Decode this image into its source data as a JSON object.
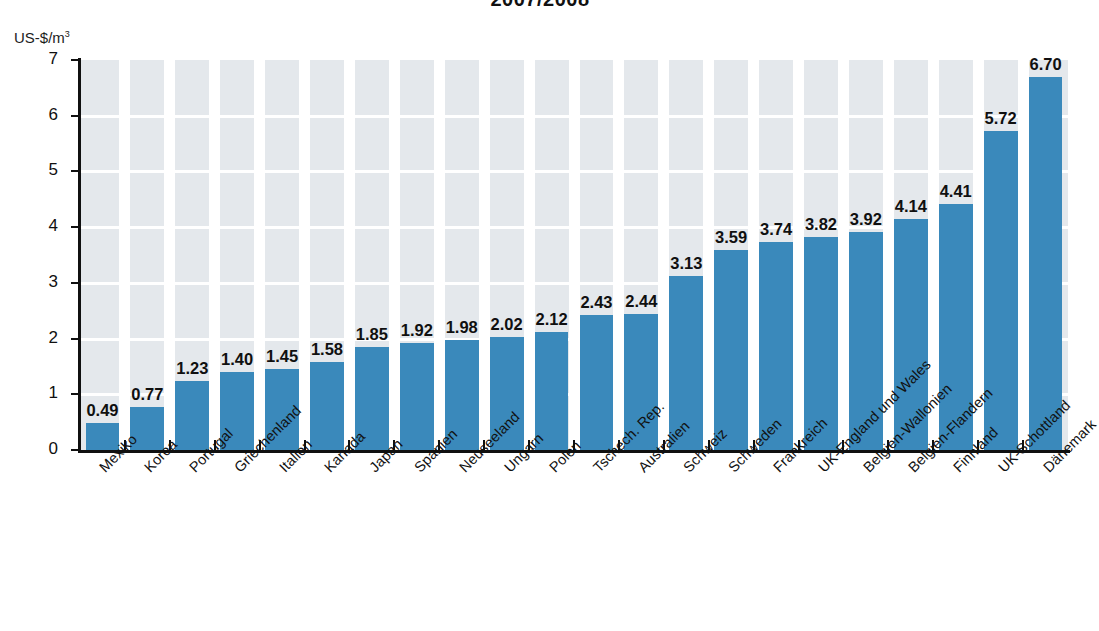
{
  "chart": {
    "title": "2007/2008",
    "y_unit_label": "US-$/m",
    "y_unit_exponent": "3"
  },
  "chart_data": {
    "type": "bar",
    "title": "2007/2008",
    "xlabel": "",
    "ylabel": "US-$/m³",
    "ylim": [
      0,
      7
    ],
    "yticks": [
      "0",
      "1",
      "2",
      "3",
      "4",
      "5",
      "6",
      "7"
    ],
    "grid": true,
    "legend": "none",
    "bar_color": "#3a89bb",
    "plot_background": "#e4e8ec",
    "gridline_color": "#ffffff",
    "categories": [
      "Mexiko",
      "Korea",
      "Portugal",
      "Griechenland",
      "Italien",
      "Kanada",
      "Japan",
      "Spanien",
      "Neuseeland",
      "Ungarn",
      "Polen",
      "Tschech. Rep.",
      "Australien",
      "Schweiz",
      "Schweden",
      "Frankreich",
      "UK-England und Wales",
      "Belgien-Wallonien",
      "Belgien-Flandern",
      "Finnland",
      "UK-Schottland",
      "Dänemark"
    ],
    "values": [
      0.49,
      0.77,
      1.23,
      1.4,
      1.45,
      1.58,
      1.85,
      1.92,
      1.98,
      2.02,
      2.12,
      2.43,
      2.44,
      3.13,
      3.59,
      3.74,
      3.82,
      3.92,
      4.14,
      4.41,
      5.72,
      6.7
    ],
    "value_labels": [
      "0.49",
      "0.77",
      "1.23",
      "1.40",
      "1.45",
      "1.58",
      "1.85",
      "1.92",
      "1.98",
      "2.02",
      "2.12",
      "2.43",
      "2.44",
      "3.13",
      "3.59",
      "3.74",
      "3.82",
      "3.92",
      "4.14",
      "4.41",
      "5.72",
      "6.70"
    ]
  }
}
